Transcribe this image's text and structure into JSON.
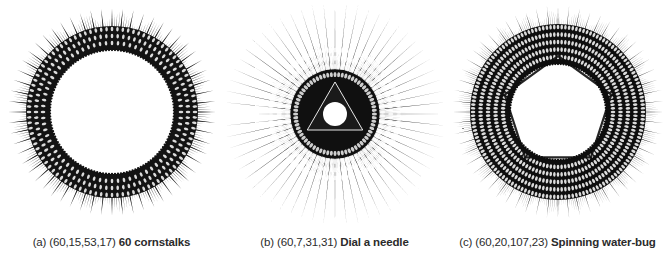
{
  "page": {
    "background_color": "#ffffff",
    "ink_color": "#111111",
    "caption_color": "#2b2b2b",
    "width": 669,
    "height": 263
  },
  "figures": [
    {
      "id": "fig-a",
      "tag": "(a)",
      "params_text": "(60,15,53,17)",
      "name": "60 cornstalks",
      "caption": "(a) (60,15,53,17) 60 cornstalks",
      "params": {
        "n": 60,
        "a": 15,
        "b": 53,
        "c": 17
      },
      "shape": "spiked-ring",
      "center": {
        "x": 112,
        "y": 112
      },
      "inner_radius": 62,
      "outer_radius": 86,
      "spike_radius": 104,
      "spike_count": 60,
      "sub_spike_count": 240,
      "hole_color": "#ffffff",
      "ring_fill": "#131313"
    },
    {
      "id": "fig-b",
      "tag": "(b)",
      "params_text": "(60,7,31,31)",
      "name": "Dial a needle",
      "caption": "(b) (60,7,31,31) Dial a needle",
      "params": {
        "n": 60,
        "a": 7,
        "b": 31,
        "c": 31
      },
      "shape": "needle-disc",
      "center": {
        "x": 112,
        "y": 114
      },
      "inner_radius": 16,
      "outer_radius": 72,
      "spike_radius": 112,
      "spike_count": 60,
      "sub_spike_count": 240,
      "hole_color": "#ffffff",
      "ring_fill": "#101010",
      "core_polygon_sides": 3,
      "core_polygon_radius": 32,
      "core_hole_radius": 12
    },
    {
      "id": "fig-c",
      "tag": "(c)",
      "params_text": "(60,20,107,23)",
      "name": "Spinning water-bug",
      "caption": "(c) (60,20,107,23) Spinning water-bug",
      "params": {
        "n": 60,
        "a": 20,
        "b": 107,
        "c": 23
      },
      "shape": "thick-annulus",
      "center": {
        "x": 112,
        "y": 112
      },
      "inner_radius": 48,
      "outer_radius": 88,
      "spike_radius": 106,
      "spike_count": 60,
      "sub_spike_count": 300,
      "hole_color": "#ffffff",
      "ring_fill": "#0e0e0e",
      "core_polygon_sides": 5,
      "core_polygon_radius": 56
    }
  ],
  "chart_data": {
    "type": "line",
    "title": "",
    "xlabel": "",
    "ylabel": "",
    "series": [
      {
        "name": "60 cornstalks",
        "params": [
          60,
          15,
          53,
          17
        ]
      },
      {
        "name": "Dial a needle",
        "params": [
          60,
          7,
          31,
          31
        ]
      },
      {
        "name": "Spinning water-bug",
        "params": [
          60,
          20,
          107,
          23
        ]
      }
    ]
  }
}
